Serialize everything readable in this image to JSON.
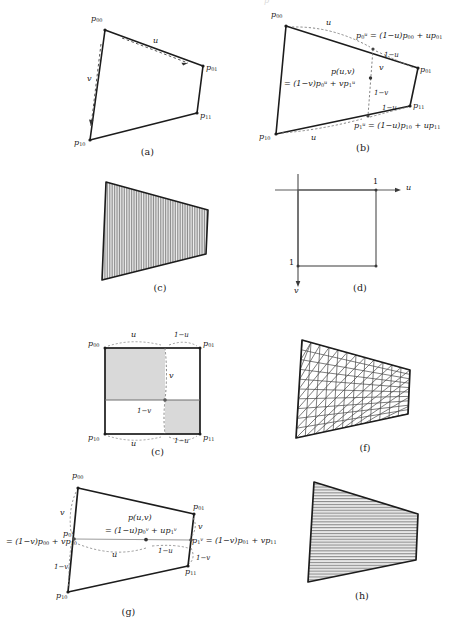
{
  "figure": {
    "stroke_color": "#1c1c1c",
    "dash_color": "#6f6f6f",
    "fill_color": "#d6d6d6",
    "hatch_color": "#7a7a7a",
    "background": "#ffffff"
  },
  "panels": [
    {
      "id": "a",
      "caption": "(a)",
      "description": "quadrilateral with u and v parameter directions",
      "labels": {
        "p00": "p00",
        "p01": "p01",
        "p10": "p10",
        "p11": "p11",
        "u": "u",
        "v": "v"
      }
    },
    {
      "id": "b",
      "caption": "(b)",
      "description": "u-first bilinear interpolation",
      "labels": {
        "p00": "p00",
        "p01": "p01",
        "p10": "p10",
        "p11": "p11",
        "u_top": "u",
        "u_bottom": "u",
        "v": "v",
        "one_minus_u_top": "1-u",
        "one_minus_u_bottom": "1-u",
        "one_minus_v": "1-v",
        "eq_top": "p0u = (1-u)p00 + up01",
        "eq_bottom": "p1u = (1-u)p10 + up11",
        "eq_center_line1": "p(u,v)",
        "eq_center_line2": "= (1-v)p0u + vp1u"
      }
    },
    {
      "id": "c",
      "caption": "(c)",
      "description": "quadrilateral filled with dense vertical hatching"
    },
    {
      "id": "d",
      "caption": "(d)",
      "description": "unit parameter square in (u,v) space",
      "labels": {
        "u_axis": "u",
        "v_axis": "v",
        "u_one": "1",
        "v_one": "1"
      }
    },
    {
      "id": "e",
      "caption": "(c)",
      "description": "unit square showing area weights, two shaded sub-rectangles",
      "labels": {
        "p00": "p00",
        "p01": "p01",
        "p10": "p10",
        "p11": "p11",
        "u_top": "u",
        "u_bottom": "u",
        "one_minus_u_top": "1-u",
        "one_minus_u_bottom": "1-u",
        "v": "v",
        "one_minus_v": "1-v"
      }
    },
    {
      "id": "f",
      "caption": "(f)",
      "description": "quadrilateral with triangulated mesh grid"
    },
    {
      "id": "g",
      "caption": "(g)",
      "description": "v-first bilinear interpolation",
      "labels": {
        "p00": "p00",
        "p01": "p01",
        "p10": "p10",
        "p11": "p11",
        "v_left": "v",
        "v_right": "v",
        "u": "u",
        "one_minus_u": "1-u",
        "one_minus_v_left": "1-v",
        "one_minus_v_right": "1-v",
        "p0v": "p0v",
        "eq_left": "= (1-v)p00 + vp10",
        "eq_right": "p1v = (1-v)p01 + vp11",
        "eq_center_line1": "p(u,v)",
        "eq_center_line2": "= (1-u)p0v + up1v"
      }
    },
    {
      "id": "h",
      "caption": "(h)",
      "description": "quadrilateral filled with horizontal hatching"
    }
  ]
}
